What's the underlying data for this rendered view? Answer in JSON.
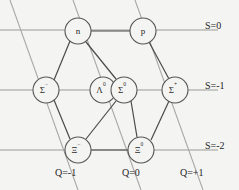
{
  "figure": {
    "type": "baryon-octet-weight-diagram",
    "background_color": "#f4f4f2",
    "line_color": "#9a9a9a",
    "bond_color": "#4a4a4a",
    "node_fill": "#f4f4f2",
    "node_stroke": "#555555",
    "text_color": "#1f1f1f"
  },
  "strangeness_axis": {
    "rows": [
      {
        "label": "S=0",
        "value": 0,
        "y": 30
      },
      {
        "label": "S=-1",
        "value": -1,
        "y": 90
      },
      {
        "label": "S=-2",
        "value": -2,
        "y": 150
      }
    ]
  },
  "charge_axis": {
    "columns": [
      {
        "label": "Q=-1",
        "value": -1,
        "x": 62
      },
      {
        "label": "Q=0",
        "value": 0,
        "x": 125
      },
      {
        "label": "Q=+1",
        "value": 1,
        "x": 186
      }
    ]
  },
  "particles": [
    {
      "name": "neutron",
      "symbol": "n",
      "superscript": "",
      "charge": 0,
      "strangeness": 0,
      "cx": 78,
      "cy": 31,
      "r": 13
    },
    {
      "name": "proton",
      "symbol": "p",
      "superscript": "",
      "charge": 1,
      "strangeness": 0,
      "cx": 143,
      "cy": 31,
      "r": 13
    },
    {
      "name": "sigma-minus",
      "symbol": "Σ",
      "superscript": "−",
      "charge": -1,
      "strangeness": -1,
      "cx": 46,
      "cy": 90,
      "r": 13
    },
    {
      "name": "lambda-zero",
      "symbol": "Λ",
      "superscript": "0",
      "charge": 0,
      "strangeness": -1,
      "cx": 103,
      "cy": 90,
      "r": 13
    },
    {
      "name": "sigma-zero",
      "symbol": "Σ",
      "superscript": "0",
      "charge": 0,
      "strangeness": -1,
      "cx": 124,
      "cy": 90,
      "r": 13
    },
    {
      "name": "sigma-plus",
      "symbol": "Σ",
      "superscript": "+",
      "charge": 1,
      "strangeness": -1,
      "cx": 175,
      "cy": 90,
      "r": 13
    },
    {
      "name": "xi-minus",
      "symbol": "Ξ",
      "superscript": "−",
      "charge": -1,
      "strangeness": -2,
      "cx": 78,
      "cy": 150,
      "r": 13
    },
    {
      "name": "xi-zero",
      "symbol": "Ξ",
      "superscript": "0",
      "charge": 0,
      "strangeness": -2,
      "cx": 141,
      "cy": 150,
      "r": 13
    }
  ],
  "bonds": [
    {
      "from": "neutron",
      "to": "proton"
    },
    {
      "from": "neutron",
      "to": "sigma-minus"
    },
    {
      "from": "neutron",
      "to": "sigma-zero"
    },
    {
      "from": "proton",
      "to": "sigma-plus"
    },
    {
      "from": "sigma-minus",
      "to": "xi-minus"
    },
    {
      "from": "sigma-zero",
      "to": "xi-minus"
    },
    {
      "from": "sigma-zero",
      "to": "xi-zero"
    },
    {
      "from": "sigma-plus",
      "to": "xi-zero"
    },
    {
      "from": "xi-minus",
      "to": "xi-zero"
    }
  ]
}
